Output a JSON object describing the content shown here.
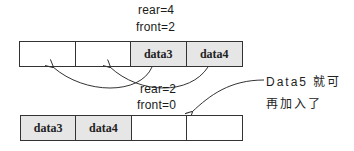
{
  "top_queue": {
    "rear_label": "rear=4",
    "front_label": "front=2",
    "cells": [
      {
        "text": "",
        "filled": false
      },
      {
        "text": "",
        "filled": false
      },
      {
        "text": "data3",
        "filled": true
      },
      {
        "text": "data4",
        "filled": true
      }
    ]
  },
  "bottom_queue": {
    "rear_label": "rear=2",
    "front_label": "front=0",
    "cells": [
      {
        "text": "data3",
        "filled": true
      },
      {
        "text": "data4",
        "filled": true
      },
      {
        "text": "",
        "filled": false
      },
      {
        "text": "",
        "filled": false
      }
    ]
  },
  "annotation": {
    "line1": "Data5 就可",
    "line2": "再加入了"
  }
}
